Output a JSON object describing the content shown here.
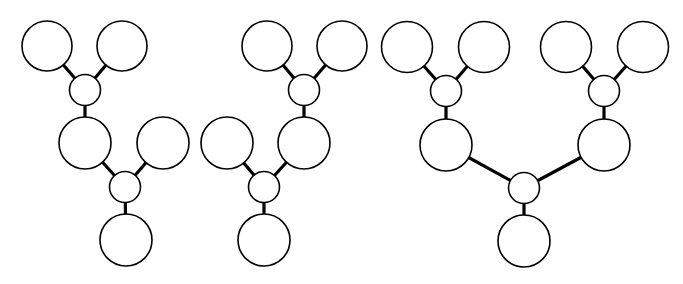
{
  "diagram": {
    "width": 683,
    "height": 284,
    "colors": {
      "background": "#ffffff",
      "stroke": "#000000",
      "fill": "#ffffff"
    },
    "trees": [
      {
        "name": "tree-1",
        "nodes": [
          {
            "id": "a",
            "type": "leaf",
            "cx": 47,
            "cy": 46,
            "r": 25
          },
          {
            "id": "b",
            "type": "leaf",
            "cx": 122,
            "cy": 46,
            "r": 25
          },
          {
            "id": "c",
            "type": "junction",
            "cx": 85,
            "cy": 90,
            "r": 15.5
          },
          {
            "id": "d",
            "type": "leaf",
            "cx": 85,
            "cy": 143,
            "r": 26
          },
          {
            "id": "e",
            "type": "leaf",
            "cx": 163,
            "cy": 143,
            "r": 26
          },
          {
            "id": "f",
            "type": "junction",
            "cx": 125,
            "cy": 187,
            "r": 15.5
          },
          {
            "id": "g",
            "type": "leaf",
            "cx": 126,
            "cy": 240,
            "r": 26
          }
        ],
        "edges": [
          [
            "a",
            "c"
          ],
          [
            "b",
            "c"
          ],
          [
            "c",
            "d"
          ],
          [
            "d",
            "f"
          ],
          [
            "e",
            "f"
          ],
          [
            "f",
            "g"
          ]
        ]
      },
      {
        "name": "tree-2",
        "nodes": [
          {
            "id": "a",
            "type": "leaf",
            "cx": 267,
            "cy": 46,
            "r": 25
          },
          {
            "id": "b",
            "type": "leaf",
            "cx": 342,
            "cy": 46,
            "r": 25
          },
          {
            "id": "c",
            "type": "junction",
            "cx": 304,
            "cy": 90,
            "r": 15.5
          },
          {
            "id": "d",
            "type": "leaf",
            "cx": 227,
            "cy": 143,
            "r": 26
          },
          {
            "id": "e",
            "type": "leaf",
            "cx": 304,
            "cy": 143,
            "r": 26
          },
          {
            "id": "f",
            "type": "junction",
            "cx": 264,
            "cy": 187,
            "r": 15.5
          },
          {
            "id": "g",
            "type": "leaf",
            "cx": 264,
            "cy": 240,
            "r": 26
          }
        ],
        "edges": [
          [
            "a",
            "c"
          ],
          [
            "b",
            "c"
          ],
          [
            "c",
            "e"
          ],
          [
            "d",
            "f"
          ],
          [
            "e",
            "f"
          ],
          [
            "f",
            "g"
          ]
        ]
      },
      {
        "name": "tree-3",
        "nodes": [
          {
            "id": "a",
            "type": "leaf",
            "cx": 407,
            "cy": 47,
            "r": 25.5
          },
          {
            "id": "b",
            "type": "leaf",
            "cx": 484,
            "cy": 47,
            "r": 25.5
          },
          {
            "id": "c",
            "type": "junction",
            "cx": 446,
            "cy": 91,
            "r": 15.5
          },
          {
            "id": "d",
            "type": "leaf",
            "cx": 566,
            "cy": 47,
            "r": 25.5
          },
          {
            "id": "e",
            "type": "leaf",
            "cx": 643,
            "cy": 47,
            "r": 25.5
          },
          {
            "id": "f",
            "type": "junction",
            "cx": 604,
            "cy": 91,
            "r": 15.5
          },
          {
            "id": "g",
            "type": "leaf",
            "cx": 446,
            "cy": 145,
            "r": 26
          },
          {
            "id": "h",
            "type": "leaf",
            "cx": 604,
            "cy": 145,
            "r": 26
          },
          {
            "id": "i",
            "type": "junction",
            "cx": 524,
            "cy": 188,
            "r": 15.5
          },
          {
            "id": "j",
            "type": "leaf",
            "cx": 524,
            "cy": 241,
            "r": 26
          }
        ],
        "edges": [
          [
            "a",
            "c"
          ],
          [
            "b",
            "c"
          ],
          [
            "c",
            "g"
          ],
          [
            "d",
            "f"
          ],
          [
            "e",
            "f"
          ],
          [
            "f",
            "h"
          ],
          [
            "g",
            "i"
          ],
          [
            "h",
            "i"
          ],
          [
            "i",
            "j"
          ]
        ]
      }
    ]
  }
}
